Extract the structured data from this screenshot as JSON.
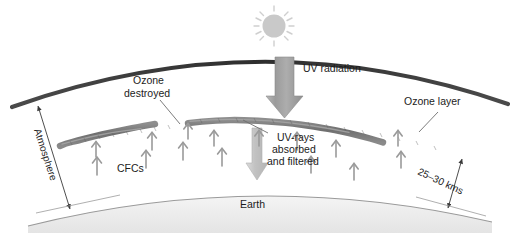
{
  "diagram": {
    "title_visible": false,
    "background_color": "#ffffff",
    "labels": {
      "ozone_destroyed_line1": "Ozone",
      "ozone_destroyed_line2": "destroyed",
      "uv_radiation": "UV radiation",
      "ozone_layer": "Ozone layer",
      "uv_absorbed_line1": "UV-rays",
      "uv_absorbed_line2": "absorbed",
      "uv_absorbed_line3": "and filtered",
      "cfcs": "CFCs",
      "atmosphere": "Atmosphere",
      "altitude": "25–30 kms",
      "earth": "Earth"
    },
    "colors": {
      "atmosphere_arc": "#3a3a3a",
      "ozone_band": "#7d7d7d",
      "sun_disc": "#c9c9c9",
      "sun_rays": "#cfcfcf",
      "uv_arrow_dark": "#a0a0a0",
      "uv_arrow_light": "#cccccc",
      "cfc_arrow": "#9a9a9a",
      "earth_fill": "#f0f0f0",
      "earth_line": "#8d8d8d",
      "leader_line": "#6e6e6e",
      "text": "#1c1c1c"
    },
    "elements": {
      "sun": {
        "cx": 274,
        "cy": 26,
        "r": 12,
        "ray_count": 8
      },
      "uv_arrow_down_main": {
        "x": 285,
        "y_top": 57,
        "y_bottom": 116
      },
      "uv_arrow_down_filtered": {
        "x": 257,
        "y_top": 128,
        "y_bottom": 178
      },
      "cfc_arrow_count": 14,
      "ozone_gap_x": 182
    }
  }
}
